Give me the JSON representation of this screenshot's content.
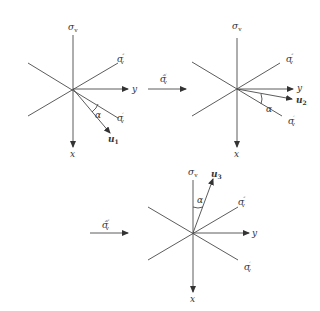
{
  "diagrams": [
    {
      "id": "panel-1",
      "labels": {
        "sigma_v": "σ",
        "sigma_v_sub": "v",
        "sigma_v2": "σ",
        "sigma_v2_sup": "″",
        "sigma_v2_sub": "v",
        "sigma_v1": "σ",
        "sigma_v1_sup": "′",
        "sigma_v1_sub": "v",
        "x_axis": "x",
        "y_axis": "y",
        "vector": "u",
        "vector_sub": "1",
        "angle": "α"
      }
    },
    {
      "id": "panel-2",
      "labels": {
        "sigma_v": "σ",
        "sigma_v_sub": "v",
        "sigma_v2": "σ",
        "sigma_v2_sup": "″",
        "sigma_v2_sub": "v",
        "sigma_v1": "σ",
        "sigma_v1_sup": "′",
        "sigma_v1_sub": "v",
        "x_axis": "x",
        "y_axis": "y",
        "vector": "u",
        "vector_sub": "2",
        "angle": "α"
      }
    },
    {
      "id": "panel-3",
      "labels": {
        "sigma_v": "σ",
        "sigma_v_sub": "v",
        "sigma_v2": "σ",
        "sigma_v2_sup": "″",
        "sigma_v2_sub": "v",
        "sigma_v1": "σ",
        "sigma_v1_sup": "′",
        "sigma_v1_sub": "v",
        "x_axis": "x",
        "y_axis": "y",
        "vector": "u",
        "vector_sub": "3",
        "angle": "α"
      }
    }
  ],
  "transitions": [
    {
      "operator": "σ̂",
      "sup": "′",
      "sub": "v"
    },
    {
      "operator": "σ̂",
      "sup": "″",
      "sub": "v"
    }
  ]
}
